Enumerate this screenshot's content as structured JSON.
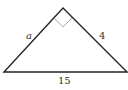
{
  "diagram": {
    "type": "right-triangle",
    "vertices": {
      "left": [
        4,
        72
      ],
      "apex": [
        63,
        8
      ],
      "right": [
        127,
        72
      ]
    },
    "right_angle_at": "apex",
    "labels": {
      "left_leg": "a",
      "right_leg": "4",
      "hypotenuse": "15"
    },
    "colors": {
      "stroke": "#222222",
      "right_angle_marker": "#aaaaaa",
      "text": "#333333"
    }
  }
}
